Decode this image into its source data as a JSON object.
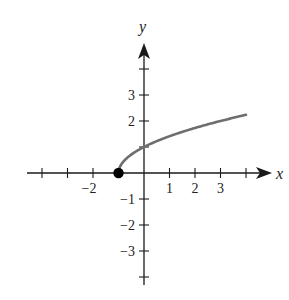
{
  "chart_data": {
    "type": "line",
    "title": "",
    "xlabel": "x",
    "ylabel": "y",
    "function": "y = sqrt(x + 1)",
    "xlim": [
      -4,
      4.9
    ],
    "ylim": [
      -4.3,
      4.9
    ],
    "x_tick_positions": [
      -4,
      -3,
      -2,
      -1,
      1,
      2,
      3,
      4
    ],
    "y_tick_positions": [
      -4,
      -3,
      -2,
      -1,
      1,
      2,
      3,
      4
    ],
    "x_tick_labels": [
      {
        "value": -2,
        "text": "−2"
      },
      {
        "value": 1,
        "text": "1"
      },
      {
        "value": 2,
        "text": "2"
      },
      {
        "value": 3,
        "text": "3"
      }
    ],
    "y_tick_labels": [
      {
        "value": 3,
        "text": "3"
      },
      {
        "value": 2,
        "text": "2"
      },
      {
        "value": -1,
        "text": "−1"
      },
      {
        "value": -2,
        "text": "−2"
      },
      {
        "value": -3,
        "text": "−3"
      }
    ],
    "series": [
      {
        "name": "sqrt(x+1)",
        "color": "#6e6e6e",
        "x": [
          -1,
          -0.75,
          -0.5,
          0,
          0.5,
          1,
          1.5,
          2,
          2.5,
          3,
          3.5,
          4
        ],
        "y": [
          0,
          0.5,
          0.71,
          1,
          1.22,
          1.41,
          1.58,
          1.73,
          1.87,
          2,
          2.12,
          2.24
        ]
      }
    ],
    "annotations": [
      {
        "type": "closed-point",
        "x": -1,
        "y": 0,
        "color": "#000000"
      }
    ],
    "grid": false,
    "legend": null
  },
  "labels": {
    "x_axis": "x",
    "y_axis": "y"
  }
}
